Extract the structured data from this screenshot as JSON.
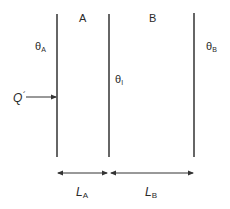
{
  "diagram": {
    "type": "composite-wall-heat-conduction",
    "layers": [
      {
        "name": "A",
        "label": "A"
      },
      {
        "name": "B",
        "label": "B"
      }
    ],
    "temperatures": {
      "theta_a": {
        "symbol": "θ",
        "sub": "A"
      },
      "theta_i": {
        "symbol": "θ",
        "sub": "I"
      },
      "theta_b": {
        "symbol": "θ",
        "sub": "B"
      }
    },
    "heat_flow": {
      "symbol": "Q",
      "prime": "´"
    },
    "thicknesses": {
      "l_a": {
        "symbol": "L",
        "sub": "A"
      },
      "l_b": {
        "symbol": "L",
        "sub": "B"
      }
    },
    "colors": {
      "line": "#333333",
      "background": "#ffffff"
    }
  }
}
